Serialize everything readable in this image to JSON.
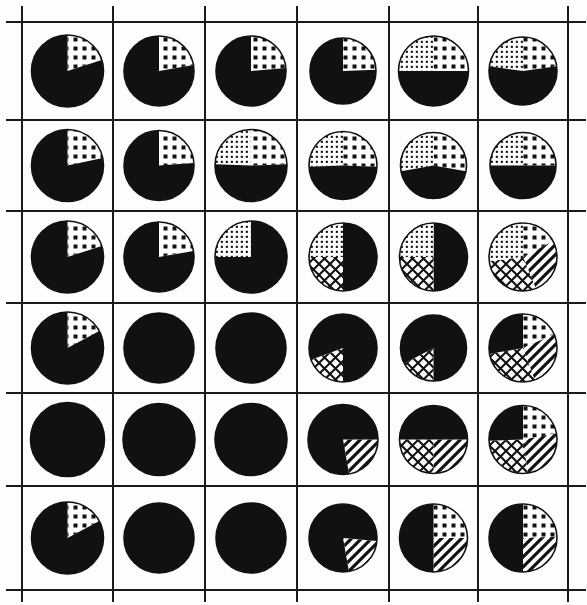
{
  "figure": {
    "type": "pie-chart-matrix",
    "rows": 6,
    "cols": 6,
    "background_color": "#fdfdfb",
    "ink_color": "#111111",
    "grid": {
      "visible": true,
      "line_color": "#1a1a1a",
      "line_width": 2,
      "v_positions": [
        22,
        113,
        205,
        297,
        389,
        478,
        568
      ],
      "h_positions": [
        22,
        120,
        211,
        303,
        393,
        486,
        590
      ]
    },
    "patterns": {
      "solid": "solid-black",
      "bigdots": "large-square-dots",
      "finedots": "fine-dot-grid",
      "cross": "diagonal-crosshatch",
      "stripe": "diagonal-stripes",
      "blank": "white"
    }
  },
  "chart_data": {
    "type": "pie",
    "title": "",
    "xlabel": "",
    "ylabel": "",
    "legend": [],
    "grid_rows": 6,
    "grid_cols": 6,
    "slice_labels": [
      "solid",
      "bigdots",
      "finedots",
      "cross",
      "stripe"
    ],
    "cells": [
      [
        {
          "r": 1,
          "c": 1,
          "radius": 36,
          "slices": [
            {
              "pattern": "bigdots",
              "start": 0,
              "sweep": 72
            },
            {
              "pattern": "solid",
              "start": 72,
              "sweep": 288
            }
          ]
        },
        {
          "r": 1,
          "c": 2,
          "radius": 35,
          "slices": [
            {
              "pattern": "bigdots",
              "start": 0,
              "sweep": 80
            },
            {
              "pattern": "solid",
              "start": 80,
              "sweep": 280
            }
          ]
        },
        {
          "r": 1,
          "c": 3,
          "radius": 35,
          "slices": [
            {
              "pattern": "bigdots",
              "start": 0,
              "sweep": 85
            },
            {
              "pattern": "solid",
              "start": 85,
              "sweep": 275
            }
          ]
        },
        {
          "r": 1,
          "c": 4,
          "radius": 33,
          "slices": [
            {
              "pattern": "bigdots",
              "start": 0,
              "sweep": 88
            },
            {
              "pattern": "solid",
              "start": 88,
              "sweep": 272
            }
          ]
        },
        {
          "r": 1,
          "c": 5,
          "radius": 35,
          "slices": [
            {
              "pattern": "bigdots",
              "start": 0,
              "sweep": 90
            },
            {
              "pattern": "finedots",
              "start": 270,
              "sweep": 90
            },
            {
              "pattern": "solid",
              "start": 90,
              "sweep": 180
            }
          ]
        },
        {
          "r": 1,
          "c": 6,
          "radius": 34,
          "slices": [
            {
              "pattern": "bigdots",
              "start": 0,
              "sweep": 82
            },
            {
              "pattern": "finedots",
              "start": 278,
              "sweep": 82
            },
            {
              "pattern": "solid",
              "start": 82,
              "sweep": 196
            }
          ]
        }
      ],
      [
        {
          "r": 2,
          "c": 1,
          "radius": 36,
          "slices": [
            {
              "pattern": "bigdots",
              "start": 0,
              "sweep": 78
            },
            {
              "pattern": "solid",
              "start": 78,
              "sweep": 282
            }
          ]
        },
        {
          "r": 2,
          "c": 2,
          "radius": 35,
          "slices": [
            {
              "pattern": "bigdots",
              "start": 0,
              "sweep": 86
            },
            {
              "pattern": "solid",
              "start": 86,
              "sweep": 274
            }
          ]
        },
        {
          "r": 2,
          "c": 3,
          "radius": 36,
          "slices": [
            {
              "pattern": "bigdots",
              "start": 0,
              "sweep": 88
            },
            {
              "pattern": "finedots",
              "start": 272,
              "sweep": 88
            },
            {
              "pattern": "solid",
              "start": 88,
              "sweep": 184
            }
          ]
        },
        {
          "r": 2,
          "c": 4,
          "radius": 34,
          "slices": [
            {
              "pattern": "bigdots",
              "start": 0,
              "sweep": 92
            },
            {
              "pattern": "finedots",
              "start": 268,
              "sweep": 92
            },
            {
              "pattern": "solid",
              "start": 92,
              "sweep": 176
            }
          ]
        },
        {
          "r": 2,
          "c": 5,
          "radius": 33,
          "slices": [
            {
              "pattern": "bigdots",
              "start": 0,
              "sweep": 100
            },
            {
              "pattern": "finedots",
              "start": 260,
              "sweep": 100
            },
            {
              "pattern": "solid",
              "start": 100,
              "sweep": 160
            }
          ]
        },
        {
          "r": 2,
          "c": 6,
          "radius": 33,
          "slices": [
            {
              "pattern": "bigdots",
              "start": 0,
              "sweep": 90
            },
            {
              "pattern": "finedots",
              "start": 270,
              "sweep": 90
            },
            {
              "pattern": "solid",
              "start": 90,
              "sweep": 180
            }
          ]
        }
      ],
      [
        {
          "r": 3,
          "c": 1,
          "radius": 36,
          "slices": [
            {
              "pattern": "bigdots",
              "start": 0,
              "sweep": 72
            },
            {
              "pattern": "solid",
              "start": 72,
              "sweep": 288
            }
          ]
        },
        {
          "r": 3,
          "c": 2,
          "radius": 35,
          "slices": [
            {
              "pattern": "bigdots",
              "start": 0,
              "sweep": 80
            },
            {
              "pattern": "solid",
              "start": 80,
              "sweep": 280
            }
          ]
        },
        {
          "r": 3,
          "c": 3,
          "radius": 36,
          "slices": [
            {
              "pattern": "finedots",
              "start": 270,
              "sweep": 90
            },
            {
              "pattern": "solid",
              "start": 0,
              "sweep": 270
            }
          ]
        },
        {
          "r": 3,
          "c": 4,
          "radius": 34,
          "slices": [
            {
              "pattern": "solid",
              "start": 0,
              "sweep": 180
            },
            {
              "pattern": "finedots",
              "start": 270,
              "sweep": 90
            },
            {
              "pattern": "cross",
              "start": 180,
              "sweep": 90
            }
          ]
        },
        {
          "r": 3,
          "c": 5,
          "radius": 34,
          "slices": [
            {
              "pattern": "solid",
              "start": 0,
              "sweep": 180
            },
            {
              "pattern": "finedots",
              "start": 270,
              "sweep": 90
            },
            {
              "pattern": "cross",
              "start": 180,
              "sweep": 90
            }
          ]
        },
        {
          "r": 3,
          "c": 6,
          "radius": 34,
          "slices": [
            {
              "pattern": "bigdots",
              "start": 0,
              "sweep": 62
            },
            {
              "pattern": "stripe",
              "start": 62,
              "sweep": 96
            },
            {
              "pattern": "cross",
              "start": 158,
              "sweep": 105
            },
            {
              "pattern": "finedots",
              "start": 263,
              "sweep": 97
            }
          ]
        }
      ],
      [
        {
          "r": 4,
          "c": 1,
          "radius": 36,
          "slices": [
            {
              "pattern": "bigdots",
              "start": 0,
              "sweep": 62
            },
            {
              "pattern": "solid",
              "start": 62,
              "sweep": 298
            }
          ]
        },
        {
          "r": 4,
          "c": 2,
          "radius": 35,
          "slices": [
            {
              "pattern": "solid",
              "start": 0,
              "sweep": 360
            }
          ]
        },
        {
          "r": 4,
          "c": 3,
          "radius": 35,
          "slices": [
            {
              "pattern": "solid",
              "start": 0,
              "sweep": 360
            }
          ]
        },
        {
          "r": 4,
          "c": 4,
          "radius": 34,
          "slices": [
            {
              "pattern": "cross",
              "start": 180,
              "sweep": 70
            },
            {
              "pattern": "solid",
              "start": 250,
              "sweep": 290
            }
          ]
        },
        {
          "r": 4,
          "c": 5,
          "radius": 33,
          "slices": [
            {
              "pattern": "cross",
              "start": 180,
              "sweep": 62
            },
            {
              "pattern": "solid",
              "start": 242,
              "sweep": 298
            }
          ]
        },
        {
          "r": 4,
          "c": 6,
          "radius": 34,
          "slices": [
            {
              "pattern": "bigdots",
              "start": 0,
              "sweep": 66
            },
            {
              "pattern": "stripe",
              "start": 66,
              "sweep": 94
            },
            {
              "pattern": "cross",
              "start": 160,
              "sweep": 100
            },
            {
              "pattern": "solid",
              "start": 260,
              "sweep": 100
            }
          ]
        }
      ],
      [
        {
          "r": 5,
          "c": 1,
          "radius": 37,
          "slices": [
            {
              "pattern": "solid",
              "start": 0,
              "sweep": 360
            }
          ]
        },
        {
          "r": 5,
          "c": 2,
          "radius": 36,
          "slices": [
            {
              "pattern": "solid",
              "start": 0,
              "sweep": 360
            }
          ]
        },
        {
          "r": 5,
          "c": 3,
          "radius": 36,
          "slices": [
            {
              "pattern": "solid",
              "start": 0,
              "sweep": 360
            }
          ]
        },
        {
          "r": 5,
          "c": 4,
          "radius": 35,
          "slices": [
            {
              "pattern": "stripe",
              "start": 90,
              "sweep": 80
            },
            {
              "pattern": "solid",
              "start": 170,
              "sweep": 280
            }
          ]
        },
        {
          "r": 5,
          "c": 5,
          "radius": 34,
          "slices": [
            {
              "pattern": "stripe",
              "start": 90,
              "sweep": 90
            },
            {
              "pattern": "cross",
              "start": 180,
              "sweep": 90
            },
            {
              "pattern": "solid",
              "start": 270,
              "sweep": 180
            }
          ]
        },
        {
          "r": 5,
          "c": 6,
          "radius": 34,
          "slices": [
            {
              "pattern": "bigdots",
              "start": 0,
              "sweep": 80
            },
            {
              "pattern": "stripe",
              "start": 80,
              "sweep": 92
            },
            {
              "pattern": "cross",
              "start": 172,
              "sweep": 96
            },
            {
              "pattern": "solid",
              "start": 268,
              "sweep": 92
            }
          ]
        }
      ],
      [
        {
          "r": 6,
          "c": 1,
          "radius": 36,
          "slices": [
            {
              "pattern": "bigdots",
              "start": 0,
              "sweep": 62
            },
            {
              "pattern": "solid",
              "start": 62,
              "sweep": 298
            }
          ]
        },
        {
          "r": 6,
          "c": 2,
          "radius": 35,
          "slices": [
            {
              "pattern": "solid",
              "start": 0,
              "sweep": 360
            }
          ]
        },
        {
          "r": 6,
          "c": 3,
          "radius": 35,
          "slices": [
            {
              "pattern": "solid",
              "start": 0,
              "sweep": 360
            }
          ]
        },
        {
          "r": 6,
          "c": 4,
          "radius": 34,
          "slices": [
            {
              "pattern": "stripe",
              "start": 95,
              "sweep": 75
            },
            {
              "pattern": "solid",
              "start": 170,
              "sweep": 285
            }
          ]
        },
        {
          "r": 6,
          "c": 5,
          "radius": 34,
          "slices": [
            {
              "pattern": "bigdots",
              "start": 0,
              "sweep": 90
            },
            {
              "pattern": "stripe",
              "start": 90,
              "sweep": 90
            },
            {
              "pattern": "solid",
              "start": 180,
              "sweep": 180
            }
          ]
        },
        {
          "r": 6,
          "c": 6,
          "radius": 34,
          "slices": [
            {
              "pattern": "bigdots",
              "start": 0,
              "sweep": 88
            },
            {
              "pattern": "stripe",
              "start": 88,
              "sweep": 92
            },
            {
              "pattern": "solid",
              "start": 180,
              "sweep": 180
            }
          ]
        }
      ]
    ]
  }
}
